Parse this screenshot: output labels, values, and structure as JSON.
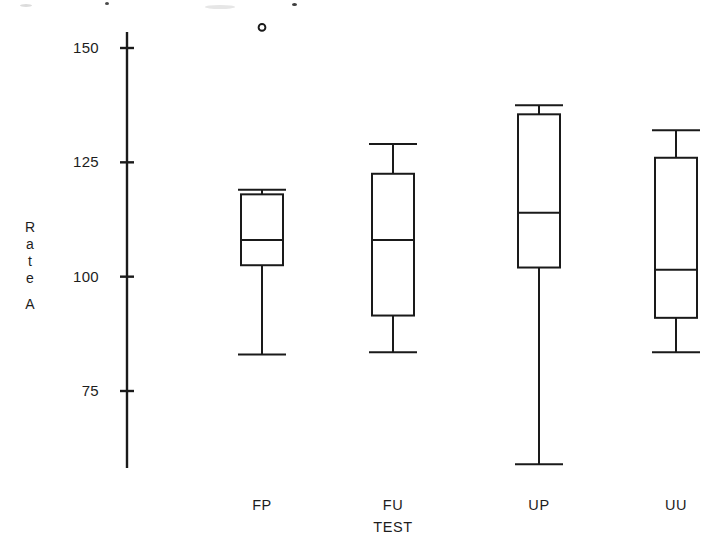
{
  "chart_data": {
    "type": "box",
    "title": "",
    "xlabel": "TEST",
    "ylabel": "Rate A",
    "categories": [
      "FP",
      "FU",
      "UP",
      "UU"
    ],
    "ytick_labels": [
      "150",
      "125",
      "100",
      "75"
    ],
    "ytick_values": [
      150,
      125,
      100,
      75
    ],
    "ylim": [
      55,
      158
    ],
    "grid": false,
    "legend": null,
    "boxes": [
      {
        "category": "FP",
        "whisker_low": 83,
        "q1": 102.5,
        "median": 108,
        "q3": 118,
        "whisker_high": 119,
        "outliers": [
          154.5
        ]
      },
      {
        "category": "FU",
        "whisker_low": 83.5,
        "q1": 91.5,
        "median": 108,
        "q3": 122.5,
        "whisker_high": 129,
        "outliers": []
      },
      {
        "category": "UP",
        "whisker_low": 59,
        "q1": 102,
        "median": 114,
        "q3": 135.5,
        "whisker_high": 137.5,
        "outliers": []
      },
      {
        "category": "UU",
        "whisker_low": 83.5,
        "q1": 91,
        "median": 101.5,
        "q3": 126,
        "whisker_high": 132,
        "outliers": []
      }
    ]
  },
  "axis": {
    "y_title_letters": [
      "R",
      "a",
      "t",
      "e",
      "A"
    ],
    "stroke_color": "#1a1a1a"
  }
}
